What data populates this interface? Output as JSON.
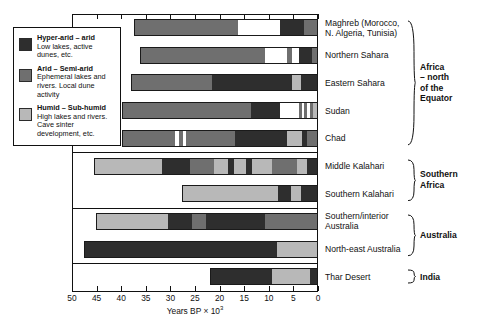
{
  "legend": {
    "items": [
      {
        "swatch": "hyper-arid",
        "title": "Hyper-arid – arid",
        "desc": "Low lakes, active dunes, etc."
      },
      {
        "swatch": "arid",
        "title": "Arid – Semi-arid",
        "desc": "Ephemeral lakes and rivers. Local dune activity"
      },
      {
        "swatch": "humid",
        "title": "Humid – Sub-humid",
        "desc": "High lakes and rivers. Cave sinter development, etc."
      }
    ]
  },
  "axis": {
    "title_text": "Years BP × 10",
    "title_exponent": "3",
    "ticks": [
      50,
      45,
      40,
      35,
      30,
      25,
      20,
      15,
      10,
      5,
      0
    ],
    "min": 0,
    "max": 50,
    "reversed": true
  },
  "groups": [
    {
      "label": "Africa\n– north\nof the\nEquator",
      "rows": 5
    },
    {
      "label": "Southern\nAfrica",
      "rows": 2
    },
    {
      "label": "Australia",
      "rows": 2
    },
    {
      "label": "India",
      "rows": 1
    }
  ],
  "rows": [
    {
      "label": "Maghreb (Morocco,\nN. Algeria, Tunisia)"
    },
    {
      "label": "Northern Sahara"
    },
    {
      "label": "Eastern Sahara"
    },
    {
      "label": "Sudan"
    },
    {
      "label": "Chad"
    },
    {
      "label": "Middle Kalahari"
    },
    {
      "label": "Southern Kalahari"
    },
    {
      "label": "Southern/interior\nAustralia"
    },
    {
      "label": "North-east Australia"
    },
    {
      "label": "Thar Desert"
    }
  ],
  "colors": {
    "hyper-arid": "#2e2e2e",
    "arid": "#6f6f6f",
    "humid": "#b8b8b8",
    "none": "#ffffff",
    "frame": "#111111",
    "background": "#ffffff"
  },
  "chart_data": {
    "type": "bar",
    "title": "",
    "subtype": "horizontal stacked categorical time-series (palaeoclimate aridity record)",
    "xlabel": "Years BP × 10^3",
    "ylabel": "",
    "xlim": [
      50,
      0
    ],
    "x_reversed": true,
    "grid": false,
    "legend_position": "top-left inside",
    "categories": [
      "hyper-arid",
      "arid",
      "humid"
    ],
    "series": [
      {
        "name": "Maghreb (Morocco, N. Algeria, Tunisia)",
        "group": "Africa – north of the Equator",
        "start": 37.5,
        "end": 0,
        "segments": [
          {
            "from": 37.5,
            "to": 16.3,
            "state": "arid"
          },
          {
            "from": 16.3,
            "to": 7.5,
            "state": "none"
          },
          {
            "from": 7.5,
            "to": 2.6,
            "state": "hyper-arid"
          },
          {
            "from": 2.6,
            "to": 0,
            "state": "arid"
          }
        ]
      },
      {
        "name": "Northern Sahara",
        "group": "Africa – north of the Equator",
        "start": 36.2,
        "end": 0,
        "segments": [
          {
            "from": 36.2,
            "to": 10.6,
            "state": "arid"
          },
          {
            "from": 10.6,
            "to": 6.1,
            "state": "none"
          },
          {
            "from": 6.1,
            "to": 5.1,
            "state": "arid"
          },
          {
            "from": 5.1,
            "to": 3.7,
            "state": "none"
          },
          {
            "from": 3.7,
            "to": 1.0,
            "state": "hyper-arid"
          },
          {
            "from": 1.0,
            "to": 0,
            "state": "arid"
          }
        ]
      },
      {
        "name": "Eastern Sahara",
        "group": "Africa – north of the Equator",
        "start": 38.0,
        "end": 0,
        "segments": [
          {
            "from": 38.0,
            "to": 21.5,
            "state": "arid"
          },
          {
            "from": 21.5,
            "to": 5.1,
            "state": "hyper-arid"
          },
          {
            "from": 5.1,
            "to": 3.3,
            "state": "humid"
          },
          {
            "from": 3.3,
            "to": 0,
            "state": "hyper-arid"
          }
        ]
      },
      {
        "name": "Sudan",
        "group": "Africa – north of the Equator",
        "start": 39.8,
        "end": 0,
        "segments": [
          {
            "from": 39.8,
            "to": 13.6,
            "state": "arid"
          },
          {
            "from": 13.6,
            "to": 7.5,
            "state": "hyper-arid"
          },
          {
            "from": 7.5,
            "to": 3.7,
            "state": "none"
          },
          {
            "from": 3.7,
            "to": 3.1,
            "state": "arid"
          },
          {
            "from": 3.1,
            "to": 2.6,
            "state": "none"
          },
          {
            "from": 2.6,
            "to": 2.0,
            "state": "arid"
          },
          {
            "from": 2.0,
            "to": 1.4,
            "state": "none"
          },
          {
            "from": 1.4,
            "to": 0.8,
            "state": "arid"
          },
          {
            "from": 0.8,
            "to": 0,
            "state": "humid"
          }
        ]
      },
      {
        "name": "Chad",
        "group": "Africa – north of the Equator",
        "start": 39.8,
        "end": 0,
        "segments": [
          {
            "from": 39.8,
            "to": 29.2,
            "state": "arid"
          },
          {
            "from": 29.2,
            "to": 28.4,
            "state": "none"
          },
          {
            "from": 28.4,
            "to": 27.6,
            "state": "arid"
          },
          {
            "from": 27.6,
            "to": 26.8,
            "state": "none"
          },
          {
            "from": 26.8,
            "to": 16.9,
            "state": "arid"
          },
          {
            "from": 16.9,
            "to": 6.1,
            "state": "hyper-arid"
          },
          {
            "from": 6.1,
            "to": 3.1,
            "state": "humid"
          },
          {
            "from": 3.1,
            "to": 2.0,
            "state": "hyper-arid"
          },
          {
            "from": 2.0,
            "to": 0,
            "state": "arid"
          }
        ]
      },
      {
        "name": "Middle Kalahari",
        "group": "Southern Africa",
        "start": 45.5,
        "end": 0,
        "segments": [
          {
            "from": 45.5,
            "to": 31.7,
            "state": "humid"
          },
          {
            "from": 31.7,
            "to": 26.0,
            "state": "hyper-arid"
          },
          {
            "from": 26.0,
            "to": 21.1,
            "state": "arid"
          },
          {
            "from": 21.1,
            "to": 18.3,
            "state": "humid"
          },
          {
            "from": 18.3,
            "to": 17.1,
            "state": "hyper-arid"
          },
          {
            "from": 17.1,
            "to": 14.6,
            "state": "humid"
          },
          {
            "from": 14.6,
            "to": 13.4,
            "state": "hyper-arid"
          },
          {
            "from": 13.4,
            "to": 9.3,
            "state": "humid"
          },
          {
            "from": 9.3,
            "to": 4.1,
            "state": "arid"
          },
          {
            "from": 4.1,
            "to": 2.0,
            "state": "humid"
          },
          {
            "from": 2.0,
            "to": 0,
            "state": "hyper-arid"
          }
        ]
      },
      {
        "name": "Southern Kalahari",
        "group": "Southern Africa",
        "start": 27.6,
        "end": 0,
        "segments": [
          {
            "from": 27.6,
            "to": 8.1,
            "state": "humid"
          },
          {
            "from": 8.1,
            "to": 5.3,
            "state": "hyper-arid"
          },
          {
            "from": 5.3,
            "to": 3.3,
            "state": "humid"
          },
          {
            "from": 3.3,
            "to": 0,
            "state": "hyper-arid"
          }
        ]
      },
      {
        "name": "Southern/interior Australia",
        "group": "Australia",
        "start": 45.1,
        "end": 0,
        "segments": [
          {
            "from": 45.1,
            "to": 30.5,
            "state": "humid"
          },
          {
            "from": 30.5,
            "to": 25.6,
            "state": "hyper-arid"
          },
          {
            "from": 25.6,
            "to": 22.8,
            "state": "arid"
          },
          {
            "from": 22.8,
            "to": 10.6,
            "state": "hyper-arid"
          },
          {
            "from": 10.6,
            "to": 0,
            "state": "arid"
          }
        ]
      },
      {
        "name": "North-east Australia",
        "group": "Australia",
        "start": 47.6,
        "end": 0,
        "segments": [
          {
            "from": 47.6,
            "to": 8.1,
            "state": "hyper-arid"
          },
          {
            "from": 8.1,
            "to": 0,
            "state": "humid"
          }
        ]
      },
      {
        "name": "Thar Desert",
        "group": "India",
        "start": 22.0,
        "end": 0,
        "segments": [
          {
            "from": 22.0,
            "to": 9.3,
            "state": "hyper-arid"
          },
          {
            "from": 9.3,
            "to": 1.4,
            "state": "humid"
          },
          {
            "from": 1.4,
            "to": 0,
            "state": "hyper-arid"
          }
        ]
      }
    ]
  }
}
